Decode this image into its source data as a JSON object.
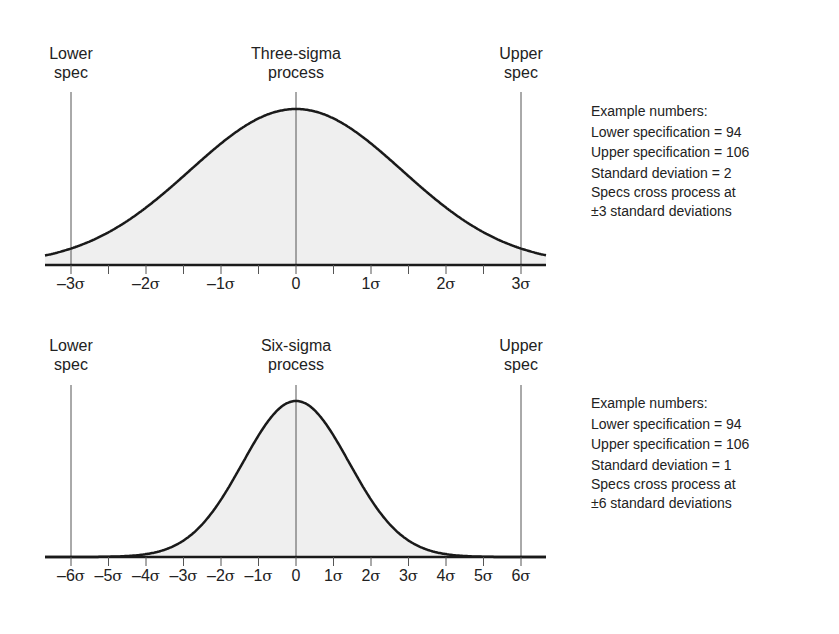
{
  "chart_data": [
    {
      "type": "area",
      "title": "Three-sigma process",
      "distribution": "normal",
      "mean": 0,
      "sigma_units": 1,
      "x_ticks": [
        "-3σ",
        "-2σ",
        "-1σ",
        "0",
        "1σ",
        "2σ",
        "3σ"
      ],
      "x_range_sigma": [
        -3,
        3
      ],
      "lower_spec_sigma": -3,
      "upper_spec_sigma": 3,
      "annotations": [
        "Lower spec",
        "Upper spec",
        "Three-sigma process"
      ],
      "example_numbers": {
        "lower_specification": 94,
        "upper_specification": 106,
        "standard_deviation": 2,
        "specs_cross_at_sigma": 3
      }
    },
    {
      "type": "area",
      "title": "Six-sigma process",
      "distribution": "normal",
      "mean": 0,
      "sigma_units": 1,
      "x_ticks": [
        "-6σ",
        "-5σ",
        "-4σ",
        "-3σ",
        "-2σ",
        "-1σ",
        "0",
        "1σ",
        "2σ",
        "3σ",
        "4σ",
        "5σ",
        "6σ"
      ],
      "x_range_sigma": [
        -6,
        6
      ],
      "lower_spec_sigma": -6,
      "upper_spec_sigma": 6,
      "annotations": [
        "Lower spec",
        "Upper spec",
        "Six-sigma process"
      ],
      "example_numbers": {
        "lower_specification": 94,
        "upper_specification": 106,
        "standard_deviation": 1,
        "specs_cross_at_sigma": 6
      }
    }
  ],
  "top": {
    "lower_spec": [
      "Lower",
      "spec"
    ],
    "upper_spec": [
      "Upper",
      "spec"
    ],
    "process": [
      "Three-sigma",
      "process"
    ],
    "ticks": [
      "–3σ",
      "–2σ",
      "–1σ",
      "0",
      "1σ",
      "2σ",
      "3σ"
    ],
    "notes": [
      "Example numbers:",
      "Lower specification = 94",
      "Upper specification = 106",
      "Standard deviation = 2",
      "Specs cross process at",
      "±3 standard deviations"
    ]
  },
  "bottom": {
    "lower_spec": [
      "Lower",
      "spec"
    ],
    "upper_spec": [
      "Upper",
      "spec"
    ],
    "process": [
      "Six-sigma",
      "process"
    ],
    "ticks": [
      "–6σ",
      "–5σ",
      "–4σ",
      "–3σ",
      "–2σ",
      "–1σ",
      "0",
      "1σ",
      "2σ",
      "3σ",
      "4σ",
      "5σ",
      "6σ"
    ],
    "notes": [
      "Example numbers:",
      "Lower specification = 94",
      "Upper specification = 106",
      "Standard deviation = 1",
      "Specs cross process at",
      "±6 standard deviations"
    ]
  },
  "colors": {
    "fill": "#efefef",
    "curve": "#1a1a1a",
    "axis": "#1a1a1a",
    "spec_line": "#555555"
  }
}
